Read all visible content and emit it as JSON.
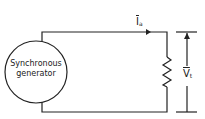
{
  "diagram": {
    "generator": {
      "line1": "Synchronous",
      "line2": "generator"
    },
    "current_label": {
      "symbol": "I",
      "subscript": "a"
    },
    "voltage_label": {
      "symbol": "V",
      "subscript": "t"
    },
    "load": "resistor-icon",
    "line_color": "#222222"
  }
}
